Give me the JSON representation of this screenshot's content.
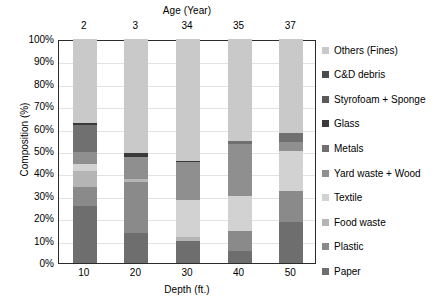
{
  "chart_data": {
    "type": "bar",
    "subtype": "stacked-percentage-column",
    "title": "",
    "xlabel": "Depth (ft.)",
    "ylabel": "Composition (%)",
    "top_axis_label": "Age (Year)",
    "categories": [
      "10",
      "20",
      "30",
      "40",
      "50"
    ],
    "top_categories": [
      "2",
      "3",
      "34",
      "35",
      "37"
    ],
    "ylim": [
      0,
      100
    ],
    "yticks": [
      "0%",
      "10%",
      "20%",
      "30%",
      "40%",
      "50%",
      "60%",
      "70%",
      "80%",
      "90%",
      "100%"
    ],
    "ytick_values": [
      0,
      10,
      20,
      30,
      40,
      50,
      60,
      70,
      80,
      90,
      100
    ],
    "grid": true,
    "legend_position": "right",
    "stack_order_bottom_to_top": [
      "Paper",
      "Plastic",
      "Food waste",
      "Textile",
      "Yard waste + Wood",
      "Metals",
      "Glass",
      "Styrofoam + Sponge",
      "C&D debris",
      "Others (Fines)"
    ],
    "series": [
      {
        "name": "Paper",
        "color": "#6e6e6e",
        "values": [
          25.5,
          13.5,
          10.0,
          5.5,
          18.5
        ]
      },
      {
        "name": "Plastic",
        "color": "#8a8a8a",
        "values": [
          8.5,
          22.5,
          0.0,
          9.0,
          13.5
        ]
      },
      {
        "name": "Food waste",
        "color": "#b5b5b5",
        "values": [
          7.0,
          1.5,
          1.5,
          0.0,
          0.0
        ]
      },
      {
        "name": "Textile",
        "color": "#d2d2d2",
        "values": [
          3.0,
          0.0,
          16.5,
          15.5,
          18.0
        ]
      },
      {
        "name": "Yard waste + Wood",
        "color": "#8f8f8f",
        "values": [
          5.5,
          10.0,
          17.0,
          23.0,
          4.0
        ]
      },
      {
        "name": "Metals",
        "color": "#707070",
        "values": [
          12.0,
          0.0,
          0.0,
          1.5,
          4.0
        ]
      },
      {
        "name": "Glass",
        "color": "#3a3a3a",
        "values": [
          1.0,
          1.5,
          0.5,
          0.0,
          0.0
        ]
      },
      {
        "name": "Styrofoam + Sponge",
        "color": "#5a5a5a",
        "values": [
          0.0,
          0.0,
          0.0,
          0.0,
          0.0
        ]
      },
      {
        "name": "C&D debris",
        "color": "#4a4a4a",
        "values": [
          0.0,
          0.0,
          0.0,
          0.0,
          0.0
        ]
      },
      {
        "name": "Others (Fines)",
        "color": "#c9c9c9",
        "values": [
          37.5,
          51.0,
          54.5,
          45.5,
          42.0
        ]
      }
    ],
    "legend_entries_top_to_bottom": [
      {
        "label": "Others (Fines)",
        "color": "#c9c9c9"
      },
      {
        "label": "C&D debris",
        "color": "#4a4a4a"
      },
      {
        "label": "Styrofoam + Sponge",
        "color": "#5a5a5a"
      },
      {
        "label": "Glass",
        "color": "#3a3a3a"
      },
      {
        "label": "Metals",
        "color": "#707070"
      },
      {
        "label": "Yard waste + Wood",
        "color": "#8f8f8f"
      },
      {
        "label": "Textile",
        "color": "#d2d2d2"
      },
      {
        "label": "Food waste",
        "color": "#b5b5b5"
      },
      {
        "label": "Plastic",
        "color": "#8a8a8a"
      },
      {
        "label": "Paper",
        "color": "#6e6e6e"
      }
    ]
  }
}
